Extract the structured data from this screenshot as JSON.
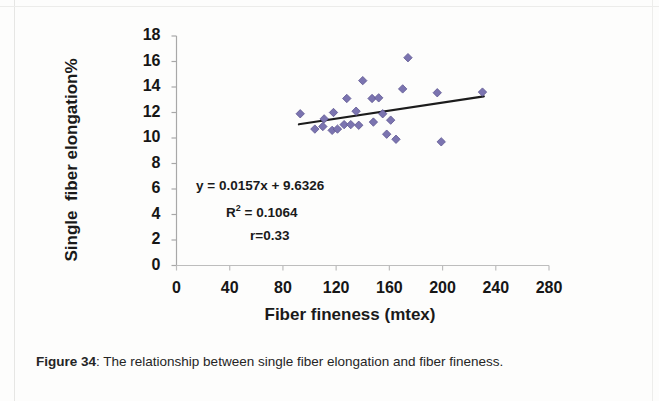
{
  "figure": {
    "caption_label": "Figure 34",
    "caption_separator": ":",
    "caption_text": " The relationship between single fiber elongation and fiber fineness."
  },
  "annotations": {
    "equation": "y = 0.0157x + 9.6326",
    "r_squared_prefix": "R",
    "r_squared_exponent": "2",
    "r_squared_value": " = 0.1064",
    "correlation": "r=0.33"
  },
  "colors": {
    "marker": "#7b74b0",
    "marker_edge": "#5d5691",
    "trendline": "#1c1c1c",
    "axis": "#9a9a9a",
    "text": "#161616"
  },
  "chart_data": {
    "type": "scatter",
    "title": "",
    "xlabel": "Fiber fineness (mtex)",
    "ylabel": "Single  fiber elongation%",
    "xlim": [
      0,
      280
    ],
    "ylim": [
      0,
      18
    ],
    "xticks": [
      0,
      40,
      80,
      120,
      160,
      200,
      240,
      280
    ],
    "yticks": [
      0,
      2,
      4,
      6,
      8,
      10,
      12,
      14,
      16,
      18
    ],
    "grid": false,
    "legend": null,
    "marker_shape": "diamond",
    "series": [
      {
        "name": "Single fiber elongation vs fiber fineness",
        "points": [
          [
            93,
            11.9
          ],
          [
            104,
            10.7
          ],
          [
            110,
            10.9
          ],
          [
            111,
            11.5
          ],
          [
            117,
            10.6
          ],
          [
            118,
            12.0
          ],
          [
            121,
            10.7
          ],
          [
            126,
            11.05
          ],
          [
            128,
            13.1
          ],
          [
            131,
            11.05
          ],
          [
            135,
            12.1
          ],
          [
            137,
            11.0
          ],
          [
            140,
            14.5
          ],
          [
            147,
            13.1
          ],
          [
            148,
            11.25
          ],
          [
            152,
            13.15
          ],
          [
            155,
            11.9
          ],
          [
            158,
            10.3
          ],
          [
            161,
            11.4
          ],
          [
            165,
            9.9
          ],
          [
            170,
            13.85
          ],
          [
            174,
            16.3
          ],
          [
            196,
            13.55
          ],
          [
            199,
            9.7
          ],
          [
            230,
            13.6
          ]
        ]
      }
    ],
    "trendline": {
      "equation": "y = 0.0157x + 9.6326",
      "slope": 0.0157,
      "intercept": 9.6326,
      "r_squared": 0.1064,
      "r": 0.33,
      "x_start": 92,
      "x_end": 231
    }
  }
}
